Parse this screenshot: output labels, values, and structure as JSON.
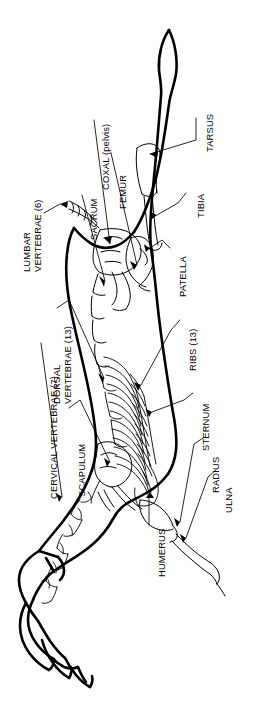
{
  "figure": {
    "orientation_degrees": -90,
    "background_color": "#ffffff",
    "line_color": "#000000",
    "canvas": {
      "width": 275,
      "height": 702
    }
  },
  "labels": [
    {
      "id": "tarsus",
      "text": "TARSUS",
      "lines": [
        "TARSUS"
      ]
    },
    {
      "id": "coxal",
      "text": "COXAL (pelvis)",
      "lines": [
        "COXAL (pelvis)"
      ]
    },
    {
      "id": "tibia",
      "text": "TIBIA",
      "lines": [
        "TIBIA"
      ]
    },
    {
      "id": "femur",
      "text": "FEMUR",
      "lines": [
        "FEMUR"
      ]
    },
    {
      "id": "sacrum",
      "text": "SACRUM",
      "lines": [
        "SACRUM"
      ]
    },
    {
      "id": "patella",
      "text": "PATELLA",
      "lines": [
        "PATELLA"
      ]
    },
    {
      "id": "lumbar-vertebrae",
      "text": "LUMBAR VERTEBRAE (6)",
      "lines": [
        "LUMBAR",
        "VERTEBRAE (6)"
      ]
    },
    {
      "id": "dorsal-vertebrae",
      "text": "DORSAL VERTEBRAE (13)",
      "lines": [
        "DORSAL",
        "VERTEBRAE (13)"
      ]
    },
    {
      "id": "ribs",
      "text": "RIBS (13)",
      "lines": [
        "RIBS (13)"
      ]
    },
    {
      "id": "cervical-vertebrae",
      "text": "CERVICAL VERTEBRAE (7)",
      "lines": [
        "CERVICAL VERTEBRAE (7)"
      ]
    },
    {
      "id": "scapulum",
      "text": "SCAPULUM",
      "lines": [
        "SCAPULUM"
      ]
    },
    {
      "id": "sternum",
      "text": "STERNUM",
      "lines": [
        "STERNUM"
      ]
    },
    {
      "id": "radius",
      "text": "RADIUS",
      "lines": [
        "RADIUS"
      ]
    },
    {
      "id": "ulna",
      "text": "ULNA",
      "lines": [
        "ULNA"
      ]
    },
    {
      "id": "humerus",
      "text": "HUMERUS",
      "lines": [
        "HUMERUS"
      ]
    }
  ]
}
